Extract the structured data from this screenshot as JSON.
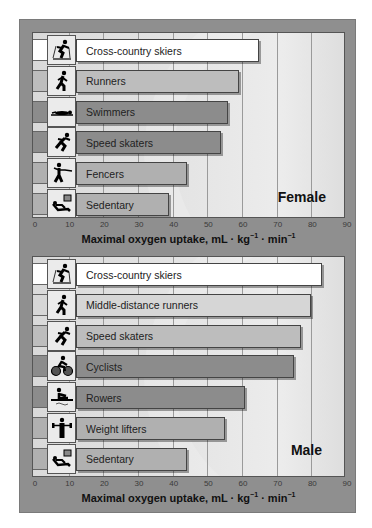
{
  "chart_data": [
    {
      "type": "bar",
      "orientation": "horizontal",
      "title": "Female",
      "categories": [
        "Cross-country skiers",
        "Runners",
        "Swimmers",
        "Speed skaters",
        "Fencers",
        "Sedentary"
      ],
      "values": [
        65,
        59,
        56,
        54,
        44,
        39
      ],
      "icons": [
        "skier-icon",
        "runner-icon",
        "swimmer-icon",
        "skater-icon",
        "fencer-icon",
        "sedentary-icon"
      ],
      "colors": [
        "#ffffff",
        "#bdbdbd",
        "#8c8c8c",
        "#8c8c8c",
        "#b0b0b0",
        "#b0b0b0"
      ],
      "xlabel": "Maximal oxygen uptake, mL · kg⁻¹ · min⁻¹",
      "ylabel": "",
      "xticks": [
        0,
        10,
        20,
        30,
        40,
        50,
        60,
        70,
        80,
        90
      ],
      "xlim": [
        0,
        90
      ],
      "grid": true,
      "legend": "none"
    },
    {
      "type": "bar",
      "orientation": "horizontal",
      "title": "Male",
      "categories": [
        "Cross-country skiers",
        "Middle-distance runners",
        "Speed skaters",
        "Cyclists",
        "Rowers",
        "Weight lifters",
        "Sedentary"
      ],
      "values": [
        83,
        80,
        77,
        75,
        61,
        55,
        44
      ],
      "icons": [
        "skier-icon",
        "runner-icon",
        "skater-icon",
        "cyclist-icon",
        "rower-icon",
        "weightlifter-icon",
        "sedentary-icon"
      ],
      "colors": [
        "#ffffff",
        "#d6d6d6",
        "#bdbdbd",
        "#8c8c8c",
        "#8c8c8c",
        "#b0b0b0",
        "#b0b0b0"
      ],
      "xlabel": "Maximal oxygen uptake, mL · kg⁻¹ · min⁻¹",
      "ylabel": "",
      "xticks": [
        0,
        10,
        20,
        30,
        40,
        50,
        60,
        70,
        80,
        90
      ],
      "xlim": [
        0,
        90
      ],
      "grid": true,
      "legend": "none"
    }
  ],
  "female": {
    "label": "Female",
    "xlabel_main": "Maximal oxygen uptake, mL · kg",
    "xlabel_sup1": "−1",
    "xlabel_mid": " · min",
    "xlabel_sup2": "−1"
  },
  "male": {
    "label": "Male",
    "xlabel_main": "Maximal oxygen uptake, mL · kg",
    "xlabel_sup1": "−1",
    "xlabel_mid": " · min",
    "xlabel_sup2": "−1"
  }
}
